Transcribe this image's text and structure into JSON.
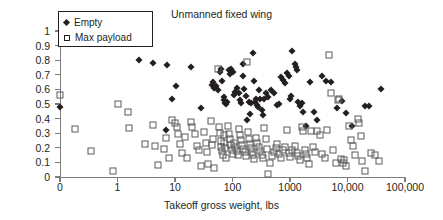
{
  "chart_data": {
    "type": "scatter",
    "title": "Unmanned fixed wing",
    "xlabel": "Takeoff gross weight, lbs",
    "ylabel": "Mass fractions",
    "xscale": "log",
    "xlim": [
      0,
      100000
    ],
    "ylim": [
      0,
      1
    ],
    "grid": false,
    "legend_position": "top-left",
    "xticks": [
      {
        "label": "0",
        "value": 0
      },
      {
        "label": "1",
        "value": 1
      },
      {
        "label": "10",
        "value": 10
      },
      {
        "label": "100",
        "value": 100
      },
      {
        "label": "1000",
        "value": 1000
      },
      {
        "label": "10,000",
        "value": 10000
      },
      {
        "label": "100,000",
        "value": 100000
      }
    ],
    "yticks": [
      "0",
      "0.1",
      "0.2",
      "0.3",
      "0.4",
      "0.5",
      "0.6",
      "0.7",
      "0.8",
      "0.9",
      "1"
    ],
    "series": [
      {
        "name": "Empty",
        "marker": "filled-diamond",
        "color": "#231f20",
        "points": [
          [
            0,
            0.478
          ],
          [
            2.4,
            0.8
          ],
          [
            4.2,
            0.778
          ],
          [
            7.0,
            0.325
          ],
          [
            7.2,
            0.765
          ],
          [
            9.0,
            0.535
          ],
          [
            10.5,
            0.622
          ],
          [
            19,
            0.755
          ],
          [
            28,
            0.472
          ],
          [
            44,
            0.633
          ],
          [
            46,
            0.648
          ],
          [
            48,
            0.612
          ],
          [
            52,
            0.625
          ],
          [
            55,
            0.597
          ],
          [
            60,
            0.718
          ],
          [
            62,
            0.737
          ],
          [
            66,
            0.655
          ],
          [
            70,
            0.527
          ],
          [
            72,
            0.545
          ],
          [
            75,
            0.505
          ],
          [
            78,
            0.498
          ],
          [
            80,
            0.515
          ],
          [
            88,
            0.735
          ],
          [
            92,
            0.705
          ],
          [
            96,
            0.743
          ],
          [
            100,
            0.718
          ],
          [
            105,
            0.563
          ],
          [
            110,
            0.585
          ],
          [
            120,
            0.612
          ],
          [
            128,
            0.575
          ],
          [
            135,
            0.525
          ],
          [
            140,
            0.508
          ],
          [
            150,
            0.772
          ],
          [
            155,
            0.695
          ],
          [
            160,
            0.602
          ],
          [
            170,
            0.555
          ],
          [
            180,
            0.392
          ],
          [
            190,
            0.515
          ],
          [
            200,
            0.432
          ],
          [
            210,
            0.505
          ],
          [
            230,
            0.852
          ],
          [
            240,
            0.655
          ],
          [
            250,
            0.512
          ],
          [
            260,
            0.533
          ],
          [
            270,
            0.492
          ],
          [
            280,
            0.478
          ],
          [
            290,
            0.595
          ],
          [
            300,
            0.537
          ],
          [
            320,
            0.462
          ],
          [
            340,
            0.423
          ],
          [
            360,
            0.532
          ],
          [
            380,
            0.575
          ],
          [
            420,
            0.545
          ],
          [
            470,
            0.598
          ],
          [
            520,
            0.572
          ],
          [
            600,
            0.492
          ],
          [
            650,
            0.502
          ],
          [
            700,
            0.688
          ],
          [
            760,
            0.665
          ],
          [
            820,
            0.643
          ],
          [
            880,
            0.712
          ],
          [
            950,
            0.693
          ],
          [
            1000,
            0.532
          ],
          [
            1050,
            0.552
          ],
          [
            1100,
            0.862
          ],
          [
            1200,
            0.775
          ],
          [
            1250,
            0.755
          ],
          [
            1300,
            0.735
          ],
          [
            1400,
            0.512
          ],
          [
            1500,
            0.486
          ],
          [
            1600,
            0.508
          ],
          [
            1700,
            0.443
          ],
          [
            1900,
            0.352
          ],
          [
            2200,
            0.648
          ],
          [
            2600,
            0.442
          ],
          [
            3000,
            0.392
          ],
          [
            3600,
            0.693
          ],
          [
            4200,
            0.655
          ],
          [
            5200,
            0.652
          ],
          [
            6500,
            0.472
          ],
          [
            8000,
            0.522
          ],
          [
            9500,
            0.438
          ],
          [
            12000,
            0.352
          ],
          [
            20000,
            0.485
          ],
          [
            24000,
            0.486
          ],
          [
            38000,
            0.605
          ]
        ]
      },
      {
        "name": "Max payload",
        "marker": "open-square",
        "color": "#5a5a5a",
        "points": [
          [
            0,
            0.562
          ],
          [
            0.18,
            0.328
          ],
          [
            0.35,
            0.175
          ],
          [
            0.85,
            0.042
          ],
          [
            1.0,
            0.498
          ],
          [
            1.5,
            0.448
          ],
          [
            1.6,
            0.335
          ],
          [
            3.0,
            0.225
          ],
          [
            4.2,
            0.355
          ],
          [
            4.5,
            0.212
          ],
          [
            5.0,
            0.085
          ],
          [
            6.5,
            0.195
          ],
          [
            7.0,
            0.268
          ],
          [
            8.0,
            0.128
          ],
          [
            9.0,
            0.393
          ],
          [
            10,
            0.372
          ],
          [
            11,
            0.345
          ],
          [
            11.5,
            0.292
          ],
          [
            12,
            0.225
          ],
          [
            13,
            0.162
          ],
          [
            15,
            0.272
          ],
          [
            16,
            0.132
          ],
          [
            19,
            0.375
          ],
          [
            20,
            0.342
          ],
          [
            22,
            0.292
          ],
          [
            24,
            0.215
          ],
          [
            26,
            0.185
          ],
          [
            28,
            0.072
          ],
          [
            32,
            0.308
          ],
          [
            34,
            0.235
          ],
          [
            36,
            0.172
          ],
          [
            38,
            0.088
          ],
          [
            42,
            0.385
          ],
          [
            44,
            0.222
          ],
          [
            46,
            0.262
          ],
          [
            48,
            0.065
          ],
          [
            55,
            0.743
          ],
          [
            58,
            0.345
          ],
          [
            60,
            0.302
          ],
          [
            62,
            0.245
          ],
          [
            64,
            0.205
          ],
          [
            66,
            0.175
          ],
          [
            68,
            0.148
          ],
          [
            70,
            0.285
          ],
          [
            72,
            0.232
          ],
          [
            74,
            0.198
          ],
          [
            78,
            0.128
          ],
          [
            82,
            0.348
          ],
          [
            86,
            0.295
          ],
          [
            90,
            0.262
          ],
          [
            94,
            0.218
          ],
          [
            98,
            0.182
          ],
          [
            102,
            0.155
          ],
          [
            106,
            0.232
          ],
          [
            112,
            0.205
          ],
          [
            118,
            0.175
          ],
          [
            124,
            0.148
          ],
          [
            130,
            0.332
          ],
          [
            136,
            0.285
          ],
          [
            142,
            0.252
          ],
          [
            148,
            0.218
          ],
          [
            155,
            0.192
          ],
          [
            162,
            0.168
          ],
          [
            170,
            0.142
          ],
          [
            178,
            0.785
          ],
          [
            185,
            0.305
          ],
          [
            192,
            0.262
          ],
          [
            200,
            0.228
          ],
          [
            210,
            0.198
          ],
          [
            220,
            0.172
          ],
          [
            230,
            0.148
          ],
          [
            240,
            0.122
          ],
          [
            255,
            0.268
          ],
          [
            270,
            0.232
          ],
          [
            285,
            0.205
          ],
          [
            300,
            0.178
          ],
          [
            320,
            0.152
          ],
          [
            340,
            0.128
          ],
          [
            360,
            0.335
          ],
          [
            380,
            0.262
          ],
          [
            400,
            0.195
          ],
          [
            420,
            0.018
          ],
          [
            450,
            0.095
          ],
          [
            480,
            0.145
          ],
          [
            520,
            0.172
          ],
          [
            560,
            0.198
          ],
          [
            600,
            0.225
          ],
          [
            650,
            0.155
          ],
          [
            700,
            0.128
          ],
          [
            760,
            0.182
          ],
          [
            820,
            0.208
          ],
          [
            880,
            0.322
          ],
          [
            950,
            0.162
          ],
          [
            1000,
            0.135
          ],
          [
            1100,
            0.188
          ],
          [
            1200,
            0.215
          ],
          [
            1300,
            0.165
          ],
          [
            1400,
            0.142
          ],
          [
            1500,
            0.118
          ],
          [
            1600,
            0.345
          ],
          [
            1700,
            0.315
          ],
          [
            1800,
            0.185
          ],
          [
            1900,
            0.158
          ],
          [
            2000,
            0.132
          ],
          [
            2100,
            0.092
          ],
          [
            2300,
            0.318
          ],
          [
            2500,
            0.205
          ],
          [
            2700,
            0.172
          ],
          [
            3000,
            0.312
          ],
          [
            3300,
            0.285
          ],
          [
            3600,
            0.155
          ],
          [
            4000,
            0.132
          ],
          [
            4400,
            0.325
          ],
          [
            4800,
            0.838
          ],
          [
            5200,
            0.572
          ],
          [
            5600,
            0.182
          ],
          [
            6200,
            0.095
          ],
          [
            6800,
            0.525
          ],
          [
            7200,
            0.535
          ],
          [
            7600,
            0.125
          ],
          [
            8200,
            0.098
          ],
          [
            8800,
            0.115
          ],
          [
            9500,
            0.072
          ],
          [
            10500,
            0.352
          ],
          [
            11500,
            0.255
          ],
          [
            12500,
            0.212
          ],
          [
            13500,
            0.148
          ],
          [
            15000,
            0.398
          ],
          [
            16000,
            0.372
          ],
          [
            17000,
            0.282
          ],
          [
            18000,
            0.108
          ],
          [
            20000,
            0.042
          ],
          [
            26000,
            0.162
          ],
          [
            30000,
            0.148
          ],
          [
            36000,
            0.112
          ]
        ]
      }
    ]
  },
  "legend": {
    "items": [
      {
        "label": "Empty",
        "marker": "filled-diamond"
      },
      {
        "label": "Max payload",
        "marker": "open-square"
      }
    ]
  }
}
